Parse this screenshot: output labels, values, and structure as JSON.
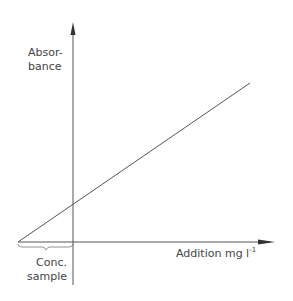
{
  "diagram": {
    "y_axis": {
      "label_line1": "Absor-",
      "label_line2": "bance"
    },
    "x_axis": {
      "label": "Addition mg l",
      "unit_sup": "-1"
    },
    "brace_label": {
      "line1": "Conc.",
      "line2": "sample"
    },
    "line": {
      "x1": 18,
      "y1": 242,
      "x2": 250,
      "y2": 83
    },
    "colors": {
      "stroke": "#555555",
      "text": "#444444"
    }
  }
}
